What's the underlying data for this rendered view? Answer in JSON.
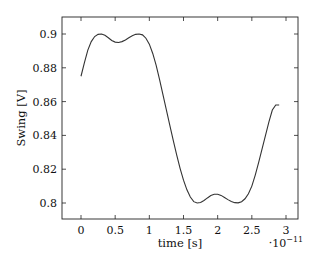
{
  "chart_data": {
    "type": "line",
    "title": "",
    "xlabel": "time [s]",
    "ylabel": "Swing [V]",
    "x_multiplier_label": "·10",
    "x_multiplier_exp": "−11",
    "xlim": [
      -0.23,
      3.17
    ],
    "ylim": [
      0.79,
      0.911
    ],
    "xticks": [
      0,
      0.5,
      1,
      1.5,
      2,
      2.5,
      3
    ],
    "xtick_labels": [
      "0",
      "0.5",
      "1",
      "1.5",
      "2",
      "2.5",
      "3"
    ],
    "yticks": [
      0.8,
      0.82,
      0.84,
      0.86,
      0.88,
      0.9
    ],
    "ytick_labels": [
      "0.8",
      "0.82",
      "0.84",
      "0.86",
      "0.88",
      "0.9"
    ],
    "grid": false,
    "legend": null,
    "series": [
      {
        "name": "Swing",
        "color": "#333333",
        "x": [
          0,
          0.05,
          0.1,
          0.15,
          0.2,
          0.25,
          0.3,
          0.35,
          0.4,
          0.45,
          0.5,
          0.55,
          0.6,
          0.65,
          0.7,
          0.75,
          0.8,
          0.85,
          0.9,
          0.95,
          1.0,
          1.05,
          1.1,
          1.15,
          1.2,
          1.25,
          1.3,
          1.35,
          1.4,
          1.45,
          1.5,
          1.55,
          1.6,
          1.65,
          1.7,
          1.75,
          1.8,
          1.85,
          1.9,
          1.95,
          2.0,
          2.05,
          2.1,
          2.15,
          2.2,
          2.25,
          2.3,
          2.35,
          2.4,
          2.45,
          2.5,
          2.55,
          2.6,
          2.65,
          2.7,
          2.75,
          2.8,
          2.85,
          2.9
        ],
        "values": [
          0.875,
          0.883,
          0.8905,
          0.8955,
          0.8985,
          0.8998,
          0.9,
          0.8992,
          0.8978,
          0.8962,
          0.8952,
          0.895,
          0.8955,
          0.8965,
          0.8978,
          0.899,
          0.8998,
          0.9,
          0.8995,
          0.8975,
          0.894,
          0.8885,
          0.8815,
          0.873,
          0.864,
          0.855,
          0.846,
          0.837,
          0.8285,
          0.8205,
          0.8135,
          0.8078,
          0.8035,
          0.8008,
          0.8,
          0.8003,
          0.8015,
          0.803,
          0.8044,
          0.8052,
          0.8052,
          0.8045,
          0.8033,
          0.802,
          0.8009,
          0.8002,
          0.8001,
          0.8008,
          0.8025,
          0.8055,
          0.81,
          0.8165,
          0.824,
          0.832,
          0.84,
          0.848,
          0.855,
          0.858,
          0.858
        ]
      }
    ]
  }
}
